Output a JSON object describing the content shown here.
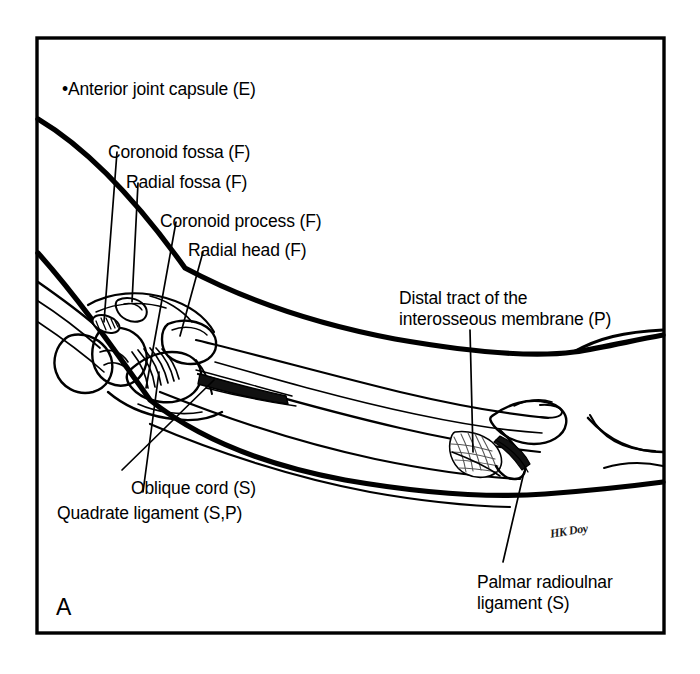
{
  "figure": {
    "panel_letter": "A",
    "signature": "HK Doy",
    "frame_color": "#000000",
    "background_color": "#ffffff",
    "ink_color": "#000000"
  },
  "labels": [
    {
      "id": "anterior-joint-capsule",
      "text": "•Anterior joint capsule (E)",
      "code": "E",
      "x": 62,
      "y": 79
    },
    {
      "id": "coronoid-fossa",
      "text": "Coronoid fossa (F)",
      "code": "F",
      "x": 108,
      "y": 142
    },
    {
      "id": "radial-fossa",
      "text": "Radial fossa (F)",
      "code": "F",
      "x": 126,
      "y": 172
    },
    {
      "id": "coronoid-process",
      "text": "Coronoid process (F)",
      "code": "F",
      "x": 160,
      "y": 211
    },
    {
      "id": "radial-head",
      "text": "Radial head (F)",
      "code": "F",
      "x": 188,
      "y": 240
    },
    {
      "id": "distal-tract-interosseous-membrane",
      "text": "Distal tract of the\ninterosseous membrane (P)",
      "code": "P",
      "x": 399,
      "y": 288
    },
    {
      "id": "oblique-cord",
      "text": "Oblique cord (S)",
      "code": "S",
      "x": 131,
      "y": 478
    },
    {
      "id": "quadrate-ligament",
      "text": "Quadrate ligament (S,P)",
      "code": "S,P",
      "x": 57,
      "y": 503
    },
    {
      "id": "palmar-radioulnar-ligament",
      "text": "Palmar radioulnar\nligament (S)",
      "code": "S",
      "x": 477,
      "y": 572
    }
  ]
}
